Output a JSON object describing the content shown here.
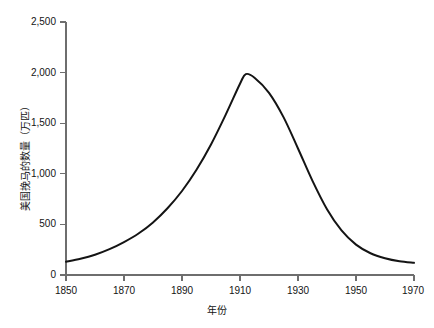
{
  "chart_data": {
    "type": "line",
    "title": "",
    "subtitle": "",
    "xlabel": "年份",
    "ylabel": "美国挽马的数量（万匹）",
    "xlim": [
      1850,
      1970
    ],
    "ylim": [
      0,
      2500
    ],
    "xticks": [
      1850,
      1870,
      1890,
      1910,
      1930,
      1950,
      1970
    ],
    "xtick_labels": [
      "1850",
      "1870",
      "1890",
      "1910",
      "1930",
      "1950",
      "1970"
    ],
    "yticks": [
      0,
      500,
      1000,
      1500,
      2000,
      2500
    ],
    "ytick_labels": [
      "0",
      "500",
      "1,000",
      "1,500",
      "2,000",
      "2,500"
    ],
    "grid": false,
    "legend": "none",
    "line_color": "#141414",
    "line_width": 2,
    "axis_color": "#6e6e6e",
    "background": "#ffffff",
    "series": [
      {
        "name": "美国挽马的数量",
        "x": [
          1850,
          1855,
          1860,
          1865,
          1870,
          1875,
          1880,
          1885,
          1890,
          1895,
          1900,
          1905,
          1910,
          1912,
          1915,
          1920,
          1925,
          1930,
          1935,
          1940,
          1945,
          1950,
          1955,
          1960,
          1965,
          1970
        ],
        "values": [
          130,
          160,
          200,
          255,
          325,
          410,
          520,
          660,
          830,
          1040,
          1290,
          1580,
          1890,
          1985,
          1950,
          1800,
          1560,
          1250,
          930,
          650,
          440,
          300,
          215,
          165,
          135,
          120
        ]
      }
    ],
    "annotations": []
  },
  "axes": {
    "y_title": "美国挽马的数量（万匹）",
    "x_title": "年份"
  }
}
